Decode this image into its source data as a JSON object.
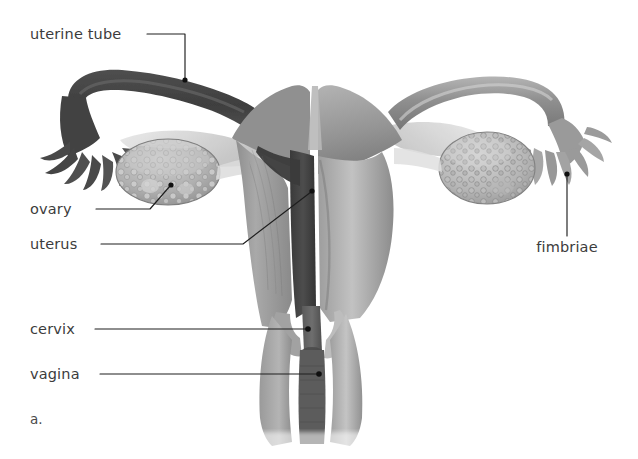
{
  "figure": {
    "panel_letter": "a.",
    "background_color": "#ffffff",
    "label_color": "#3c3c3c",
    "leader_color": "#1e1e1e",
    "width": 638,
    "height": 459
  },
  "labels": [
    {
      "id": "uterine-tube",
      "text": "uterine tube",
      "text_x": 30,
      "text_y": 39,
      "anchor": "start",
      "leader": "M 147 34 L 185 34 L 185 79",
      "dot_x": 185,
      "dot_y": 80
    },
    {
      "id": "ovary",
      "text": "ovary",
      "text_x": 30,
      "text_y": 214,
      "anchor": "start",
      "leader": "M 96 209 L 150 209 L 170 186",
      "dot_x": 171,
      "dot_y": 185
    },
    {
      "id": "uterus",
      "text": "uterus",
      "text_x": 30,
      "text_y": 249,
      "anchor": "start",
      "leader": "M 101 244 L 243 244 L 311 192",
      "dot_x": 312,
      "dot_y": 191
    },
    {
      "id": "cervix",
      "text": "cervix",
      "text_x": 30,
      "text_y": 334,
      "anchor": "start",
      "leader": "M 95 329 L 307 329",
      "dot_x": 308,
      "dot_y": 329
    },
    {
      "id": "vagina",
      "text": "vagina",
      "text_x": 30,
      "text_y": 379,
      "anchor": "start",
      "leader": "M 100 374 L 318 374",
      "dot_x": 319,
      "dot_y": 374
    },
    {
      "id": "fimbriae",
      "text": "fimbriae",
      "text_x": 567,
      "text_y": 252,
      "anchor": "middle",
      "leader": "M 567 236 L 567 175",
      "dot_x": 567,
      "dot_y": 174
    }
  ],
  "structures": [
    {
      "id": "left-uterine-tube",
      "name": "left uterine tube"
    },
    {
      "id": "left-fimbriae",
      "name": "left fimbriae"
    },
    {
      "id": "left-ovary",
      "name": "left ovary"
    },
    {
      "id": "uterus-body",
      "name": "uterus body"
    },
    {
      "id": "uterine-cavity",
      "name": "uterine cavity (endometrium)"
    },
    {
      "id": "cervix-region",
      "name": "cervix"
    },
    {
      "id": "vagina-region",
      "name": "vagina"
    },
    {
      "id": "right-uterine-tube",
      "name": "right uterine tube"
    },
    {
      "id": "right-fimbriae",
      "name": "right fimbriae"
    },
    {
      "id": "right-ovary",
      "name": "right ovary"
    }
  ]
}
